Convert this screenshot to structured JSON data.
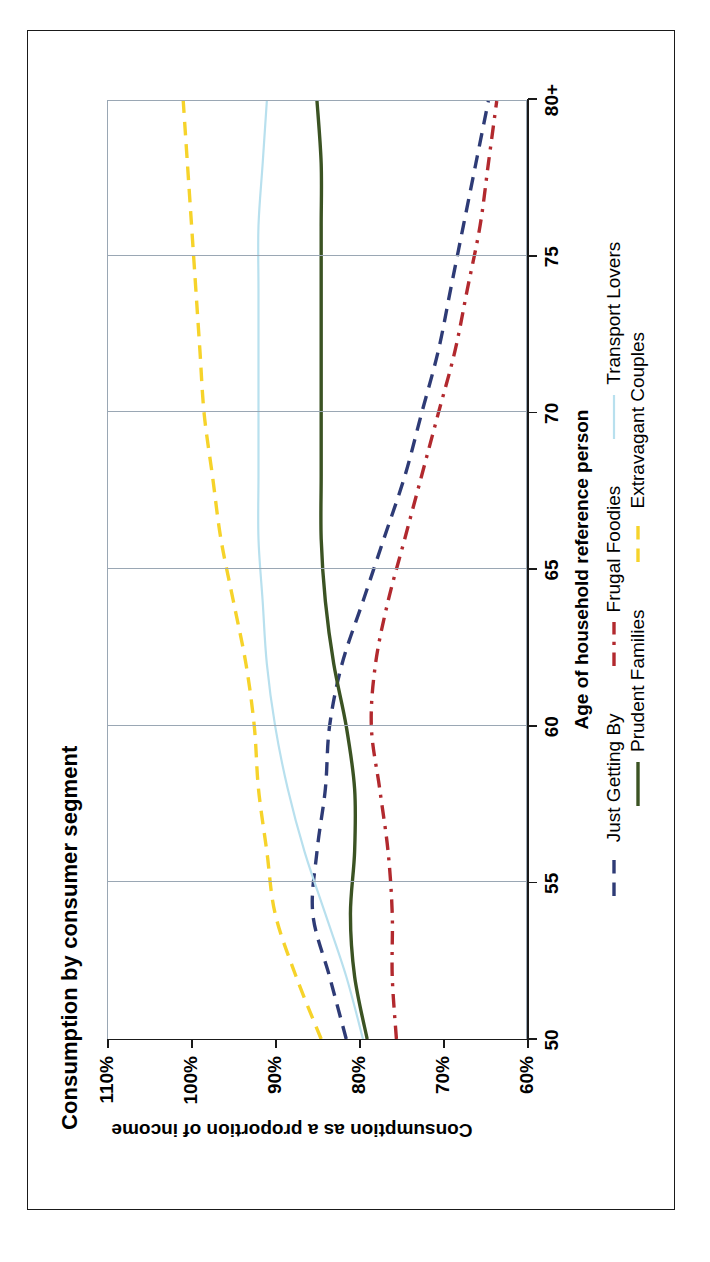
{
  "chart_data": {
    "type": "line",
    "title": "Consumption by consumer segment",
    "xlabel": "Age of household reference person",
    "ylabel": "Consumption as a proportion of income",
    "x": [
      50,
      52,
      54,
      56,
      58,
      60,
      62,
      64,
      66,
      68,
      70,
      72,
      74,
      76,
      78,
      80
    ],
    "xticks": [
      "50",
      "55",
      "60",
      "65",
      "70",
      "75",
      "80+"
    ],
    "xlim": [
      50,
      80
    ],
    "yticks": [
      "110%",
      "100%",
      "90%",
      "80%",
      "70%",
      "60%"
    ],
    "ylim": [
      60,
      110
    ],
    "grid": "vertical",
    "legend_position": "bottom",
    "series": [
      {
        "name": "Just Getting By",
        "color": "#2e3b76",
        "style": "dashed",
        "values": [
          81.5,
          83.5,
          85.5,
          85.0,
          84.0,
          83.5,
          82.0,
          79.5,
          77.0,
          74.5,
          72.5,
          70.5,
          69.0,
          67.5,
          66.0,
          64.5
        ]
      },
      {
        "name": "Frugal Foodies",
        "color": "#b2292e",
        "style": "dash-dot",
        "values": [
          75.5,
          76.0,
          76.0,
          76.5,
          77.5,
          78.5,
          78.0,
          76.5,
          74.5,
          72.5,
          70.5,
          68.5,
          67.0,
          65.5,
          64.5,
          63.5
        ]
      },
      {
        "name": "Transport Lovers",
        "color": "#b8e0ee",
        "style": "solid",
        "values": [
          79.5,
          81.5,
          84.0,
          86.5,
          88.5,
          90.0,
          91.0,
          91.5,
          92.0,
          92.0,
          92.0,
          92.0,
          92.0,
          92.0,
          91.5,
          91.0
        ]
      },
      {
        "name": "Prudent Families",
        "color": "#3b5323",
        "style": "solid",
        "values": [
          79.0,
          80.5,
          81.0,
          80.5,
          80.5,
          81.5,
          83.0,
          84.0,
          84.5,
          84.5,
          84.5,
          84.5,
          84.5,
          84.5,
          84.5,
          85.0
        ]
      },
      {
        "name": "Extravagant Couples",
        "color": "#f6d32a",
        "style": "dashed",
        "values": [
          84.5,
          87.5,
          90.0,
          91.0,
          92.0,
          92.5,
          93.5,
          95.0,
          96.5,
          97.5,
          98.5,
          99.0,
          99.5,
          100.0,
          100.5,
          101.0
        ]
      }
    ]
  }
}
